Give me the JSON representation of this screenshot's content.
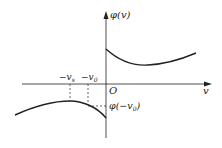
{
  "diagram": {
    "y_axis_label_fn": "φ",
    "y_axis_label_arg": "v",
    "x_axis_label": "v",
    "origin_label": "O",
    "tick_labels": [
      {
        "prefix": "−v",
        "sub": "s"
      },
      {
        "prefix": "−v",
        "sub": "0"
      }
    ],
    "value_label": {
      "fn": "φ(−v",
      "sub": "0",
      "close": ")"
    },
    "curves": [
      {
        "name": "upper-branch",
        "description": "φ(v) for v>0, decreasing from intercept to minimum then increasing"
      },
      {
        "name": "lower-branch",
        "description": "φ(v) for v<0, increasing to maximum at −v_s then decreasing toward 0"
      }
    ],
    "colors": {
      "line": "#222222",
      "background": "#ffffff"
    }
  }
}
